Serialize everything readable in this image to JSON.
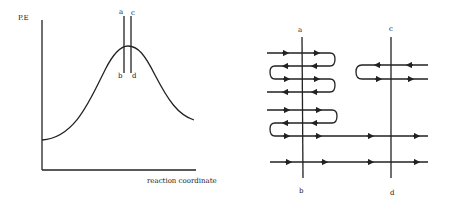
{
  "left_panel": {
    "y_axis_label": "P.E",
    "x_axis_label": "reaction coordinate",
    "line_labels": {
      "a": "a",
      "b": "b",
      "c": "c",
      "d": "d"
    },
    "description": "Potential energy profile with two vertical dividing surfaces a-b and c-d near the barrier top"
  },
  "right_panel": {
    "line_labels": {
      "a": "a",
      "b": "b",
      "c": "c",
      "d": "d"
    },
    "description": "Trajectories crossing dividing surfaces a-b and c-d; recrossings near a-b, fewer near c-d"
  },
  "colors": {
    "ink": "#222222",
    "background": "#ffffff"
  }
}
